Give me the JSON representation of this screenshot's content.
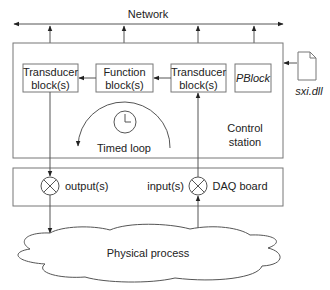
{
  "network": {
    "label": "Network"
  },
  "control_station": {
    "label_line1": "Control",
    "label_line2": "station"
  },
  "blocks": [
    {
      "id": "transducer-out",
      "line1": "Transducer",
      "line2": "block(s)"
    },
    {
      "id": "function",
      "line1": "Function",
      "line2": "block(s)"
    },
    {
      "id": "transducer-in",
      "line1": "Transducer",
      "line2": "block(s)"
    },
    {
      "id": "pblock",
      "line1": "PBlock"
    }
  ],
  "timed_loop": {
    "label": "Timed loop",
    "icon": "clock-icon"
  },
  "file": {
    "label": "sxi.dll",
    "icon": "file-icon"
  },
  "daq": {
    "label": "DAQ board",
    "output_label": "output(s)",
    "input_label": "input(s)"
  },
  "process": {
    "label": "Physical process"
  },
  "colors": {
    "line": "#555555",
    "box_border": "#777777",
    "text": "#222222",
    "background": "#ffffff"
  }
}
